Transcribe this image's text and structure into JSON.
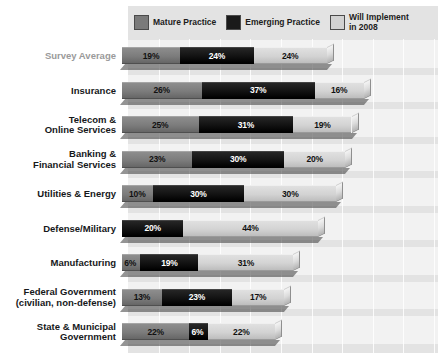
{
  "chart_data": {
    "type": "bar",
    "title": "",
    "subtitle": "",
    "orientation": "horizontal",
    "stacked": true,
    "xlabel": "",
    "ylabel": "",
    "xlim": [
      0,
      100
    ],
    "grid": "vertical-gridlines",
    "legend_position": "top",
    "value_suffix": "%",
    "categories": [
      "Survey Average",
      "Insurance",
      "Telecom &\nOnline Services",
      "Banking &\nFinancial Services",
      "Utilities & Energy",
      "Defense/Military",
      "Manufacturing",
      "Federal Government\n(civilian, non-defense)",
      "State & Municipal\nGovernment"
    ],
    "series": [
      {
        "name": "Mature Practice",
        "color": "#7a7a7a",
        "values": [
          19,
          26,
          25,
          23,
          10,
          0,
          6,
          13,
          22
        ],
        "labels": [
          "19%",
          "26%",
          "25%",
          "23%",
          "10%",
          "",
          "6%",
          "13%",
          "22%"
        ]
      },
      {
        "name": "Emerging Practice",
        "color": "#1a1a1a",
        "values": [
          24,
          37,
          31,
          30,
          30,
          20,
          19,
          23,
          6
        ],
        "labels": [
          "24%",
          "37%",
          "31%",
          "30%",
          "30%",
          "20%",
          "19%",
          "23%",
          "6%"
        ]
      },
      {
        "name": "Will Implement\nin 2008",
        "color": "#d2d2d2",
        "values": [
          24,
          16,
          19,
          20,
          30,
          44,
          31,
          17,
          22
        ],
        "labels": [
          "24%",
          "16%",
          "19%",
          "20%",
          "30%",
          "44%",
          "31%",
          "17%",
          "22%"
        ]
      }
    ],
    "totals": [
      67,
      79,
      75,
      73,
      70,
      64,
      56,
      53,
      50
    ]
  },
  "legend": {
    "items": [
      {
        "label": "Mature Practice",
        "swatch": "mature-swatch"
      },
      {
        "label": "Emerging Practice",
        "swatch": "emerging-swatch"
      },
      {
        "label": "Will Implement\nin 2008",
        "swatch": "will-implement-swatch"
      }
    ]
  },
  "rows": [
    {
      "label": "Survey Average",
      "muted": true,
      "segments": [
        {
          "kind": "mature",
          "label": "19%",
          "value": 19
        },
        {
          "kind": "emerging",
          "label": "24%",
          "value": 24
        },
        {
          "kind": "will",
          "label": "24%",
          "value": 24
        }
      ]
    },
    {
      "label": "Insurance",
      "muted": false,
      "segments": [
        {
          "kind": "mature",
          "label": "26%",
          "value": 26
        },
        {
          "kind": "emerging",
          "label": "37%",
          "value": 37
        },
        {
          "kind": "will",
          "label": "16%",
          "value": 16
        }
      ]
    },
    {
      "label": "Telecom &\nOnline Services",
      "muted": false,
      "segments": [
        {
          "kind": "mature",
          "label": "25%",
          "value": 25
        },
        {
          "kind": "emerging",
          "label": "31%",
          "value": 31
        },
        {
          "kind": "will",
          "label": "19%",
          "value": 19
        }
      ]
    },
    {
      "label": "Banking &\nFinancial Services",
      "muted": false,
      "segments": [
        {
          "kind": "mature",
          "label": "23%",
          "value": 23
        },
        {
          "kind": "emerging",
          "label": "30%",
          "value": 30
        },
        {
          "kind": "will",
          "label": "20%",
          "value": 20
        }
      ]
    },
    {
      "label": "Utilities & Energy",
      "muted": false,
      "segments": [
        {
          "kind": "mature",
          "label": "10%",
          "value": 10
        },
        {
          "kind": "emerging",
          "label": "30%",
          "value": 30
        },
        {
          "kind": "will",
          "label": "30%",
          "value": 30
        }
      ]
    },
    {
      "label": "Defense/Military",
      "muted": false,
      "segments": [
        {
          "kind": "emerging",
          "label": "20%",
          "value": 20
        },
        {
          "kind": "will",
          "label": "44%",
          "value": 44
        }
      ]
    },
    {
      "label": "Manufacturing",
      "muted": false,
      "segments": [
        {
          "kind": "mature",
          "label": "6%",
          "value": 6
        },
        {
          "kind": "emerging",
          "label": "19%",
          "value": 19
        },
        {
          "kind": "will",
          "label": "31%",
          "value": 31
        }
      ]
    },
    {
      "label": "Federal Government\n(civilian, non-defense)",
      "muted": false,
      "segments": [
        {
          "kind": "mature",
          "label": "13%",
          "value": 13
        },
        {
          "kind": "emerging",
          "label": "23%",
          "value": 23
        },
        {
          "kind": "will",
          "label": "17%",
          "value": 17
        }
      ]
    },
    {
      "label": "State & Municipal\nGovernment",
      "muted": false,
      "segments": [
        {
          "kind": "mature",
          "label": "22%",
          "value": 22
        },
        {
          "kind": "emerging",
          "label": "6%",
          "value": 6
        },
        {
          "kind": "will",
          "label": "22%",
          "value": 22
        }
      ]
    }
  ],
  "style": {
    "plot_background": "#e3e3e3",
    "band_background": "#f2f2f2",
    "gridline_color": "#ffffff",
    "mature_color": "#7a7a7a",
    "emerging_color": "#1a1a1a",
    "will_implement_color": "#d2d2d2",
    "label_color": "#16181a",
    "muted_label_color": "#9a9a9a"
  }
}
